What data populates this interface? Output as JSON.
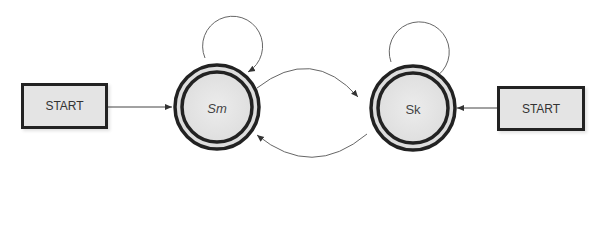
{
  "diagram": {
    "type": "state-machine",
    "states": [
      {
        "id": "sm",
        "label": "Sm",
        "accepting": true
      },
      {
        "id": "sk",
        "label": "Sk",
        "accepting": true
      }
    ],
    "start_nodes": [
      {
        "label": "START",
        "target": "sm"
      },
      {
        "label": "START",
        "target": "sk"
      }
    ],
    "transitions": [
      {
        "from": "sm",
        "to": "sm",
        "kind": "self-loop"
      },
      {
        "from": "sk",
        "to": "sk",
        "kind": "self-loop"
      },
      {
        "from": "sm",
        "to": "sk",
        "kind": "arc-top"
      },
      {
        "from": "sk",
        "to": "sm",
        "kind": "arc-bottom"
      }
    ],
    "colors": {
      "stroke": "#222222",
      "fill": "#e4e4e4",
      "line": "#555555"
    }
  }
}
